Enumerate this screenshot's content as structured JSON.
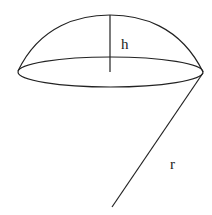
{
  "diagram": {
    "labels": {
      "height": "h",
      "radius": "r"
    },
    "stroke_color": "#222222",
    "background_color": "#ffffff"
  }
}
